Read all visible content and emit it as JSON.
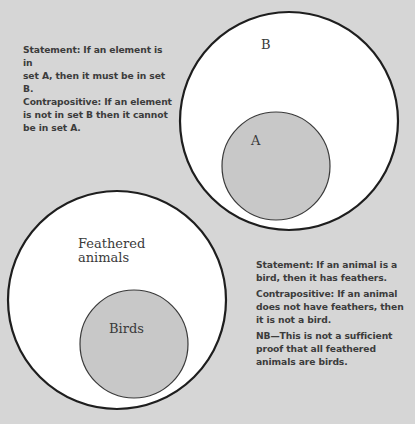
{
  "colors": {
    "background": "#d6d6d6",
    "outer_fill": "#ffffff",
    "inner_fill": "#c8c8c8",
    "outline": "#1e1e1e",
    "text": "#3c3c3c"
  },
  "diagram_top": {
    "outer_set": {
      "label": "B",
      "cx": 289,
      "cy": 121,
      "r": 109
    },
    "inner_set": {
      "label": "A",
      "cx": 276,
      "cy": 166,
      "r": 54
    },
    "note": {
      "lines": [
        "Statement: If an element is in",
        "set A, then it must be in set B.",
        "Contrapositive: If an element",
        "is not in set B then it cannot",
        "be in set A."
      ]
    }
  },
  "diagram_bottom": {
    "outer_set": {
      "label_line1": "Feathered",
      "label_line2": "animals",
      "cx": 117,
      "cy": 300,
      "r": 109
    },
    "inner_set": {
      "label": "Birds",
      "cx": 134,
      "cy": 344,
      "r": 54
    },
    "note": {
      "statement": "Statement: If an animal is a bird, then it has feathers.",
      "contrapositive": "Contrapositive: If an animal does not have feathers, then it is not a bird.",
      "nb": "NB—This is not a sufficient proof that all feathered animals are birds."
    }
  }
}
